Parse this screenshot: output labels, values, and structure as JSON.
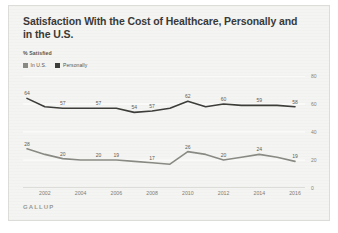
{
  "card": {
    "background_color": "#f4f4f2",
    "border_color": "#dcdcd8"
  },
  "header": {
    "title": "Satisfaction With the Cost of Healthcare, Personally and in the U.S.",
    "subtitle": "% Satisfied"
  },
  "legend": {
    "position": "top-left",
    "entries": [
      {
        "label": "In U.S.",
        "color": "#8a8a84"
      },
      {
        "label": "Personally",
        "color": "#3d3d3a"
      }
    ]
  },
  "footer": {
    "logo": "GALLUP"
  },
  "chart_data": {
    "type": "line",
    "title": "Satisfaction With the Cost of Healthcare, Personally and in the U.S.",
    "subtitle": "% Satisfied",
    "xlabel": "",
    "ylabel": "% Satisfied",
    "ylim": [
      0,
      80
    ],
    "yticks": [
      0,
      20,
      40,
      60,
      80
    ],
    "xticks": [
      2002,
      2004,
      2006,
      2008,
      2010,
      2012,
      2014,
      2016
    ],
    "xlim": [
      2001,
      2016
    ],
    "grid": true,
    "legend_position": "top-left",
    "x": [
      2001,
      2002,
      2003,
      2004,
      2005,
      2006,
      2007,
      2008,
      2009,
      2010,
      2011,
      2012,
      2013,
      2014,
      2015,
      2016
    ],
    "series": [
      {
        "name": "Personally",
        "color": "#3d3d3a",
        "values": [
          64,
          58,
          57,
          57,
          57,
          57,
          54,
          55,
          57,
          62,
          58,
          60,
          59,
          59,
          59,
          58
        ],
        "labels": [
          {
            "x": 2001,
            "value": 64
          },
          {
            "x": 2003,
            "value": 57
          },
          {
            "x": 2005,
            "value": 57
          },
          {
            "x": 2007,
            "value": 54
          },
          {
            "x": 2008,
            "value": 57
          },
          {
            "x": 2010,
            "value": 62
          },
          {
            "x": 2012,
            "value": 60
          },
          {
            "x": 2014,
            "value": 59
          },
          {
            "x": 2016,
            "value": 58
          }
        ]
      },
      {
        "name": "In U.S.",
        "color": "#8a8a84",
        "values": [
          28,
          24,
          21,
          20,
          20,
          20,
          19,
          18,
          17,
          26,
          24,
          20,
          22,
          24,
          22,
          19
        ],
        "labels": [
          {
            "x": 2001,
            "value": 28
          },
          {
            "x": 2003,
            "value": 20
          },
          {
            "x": 2005,
            "value": 20
          },
          {
            "x": 2006,
            "value": 19
          },
          {
            "x": 2008,
            "value": 17
          },
          {
            "x": 2010,
            "value": 26
          },
          {
            "x": 2012,
            "value": 20
          },
          {
            "x": 2014,
            "value": 24
          },
          {
            "x": 2016,
            "value": 19
          }
        ]
      }
    ]
  }
}
